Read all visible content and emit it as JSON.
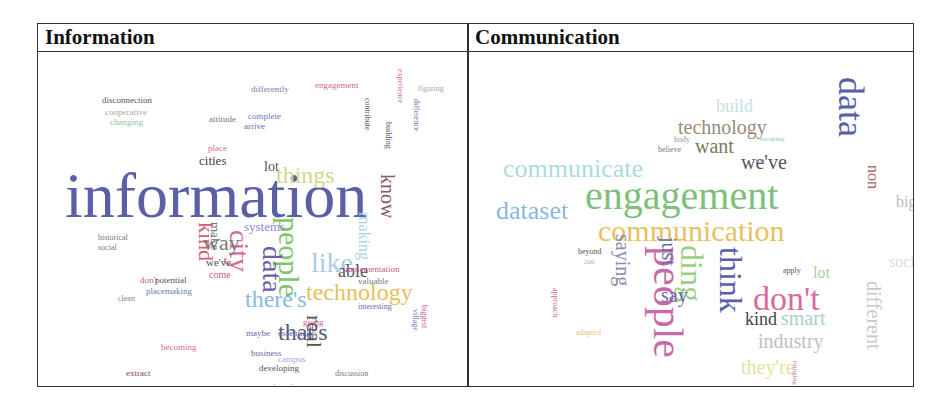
{
  "table": {
    "headers": [
      "Information",
      "Communication"
    ]
  },
  "clouds": {
    "information": {
      "words": [
        {
          "t": "information",
          "x": 27,
          "y": 112,
          "s": 64,
          "c": "#5a5fa8",
          "r": 0
        },
        {
          "t": "technology",
          "x": 268,
          "y": 228,
          "s": 24,
          "c": "#e8c05a",
          "r": 0
        },
        {
          "t": "people",
          "x": 236,
          "y": 165,
          "s": 30,
          "c": "#7ec46a",
          "r": 1
        },
        {
          "t": "there's",
          "x": 207,
          "y": 235,
          "s": 24,
          "c": "#8ab8e0",
          "r": 0
        },
        {
          "t": "that's",
          "x": 240,
          "y": 268,
          "s": 24,
          "c": "#555a80",
          "r": 0
        },
        {
          "t": "things",
          "x": 238,
          "y": 111,
          "s": 24,
          "c": "#d0d890",
          "r": 0
        },
        {
          "t": "data",
          "x": 220,
          "y": 194,
          "s": 28,
          "c": "#6a62a8",
          "r": 1
        },
        {
          "t": "city",
          "x": 187,
          "y": 178,
          "s": 28,
          "c": "#d86a9a",
          "r": 1
        },
        {
          "t": "like",
          "x": 273,
          "y": 197,
          "s": 28,
          "c": "#a8cce8",
          "r": 0
        },
        {
          "t": "know",
          "x": 340,
          "y": 122,
          "s": 20,
          "c": "#8a5a6a",
          "r": 1
        },
        {
          "t": "kind",
          "x": 157,
          "y": 170,
          "s": 22,
          "c": "#d85a7a",
          "r": 1
        },
        {
          "t": "way",
          "x": 165,
          "y": 180,
          "s": 22,
          "c": "#777",
          "r": 0
        },
        {
          "t": "real",
          "x": 265,
          "y": 263,
          "s": 22,
          "c": "#555",
          "r": 1
        },
        {
          "t": "able",
          "x": 300,
          "y": 210,
          "s": 18,
          "c": "#555",
          "r": 0
        },
        {
          "t": "cities",
          "x": 161,
          "y": 102,
          "s": 13,
          "c": "#444",
          "r": 0
        },
        {
          "t": "lot",
          "x": 226,
          "y": 108,
          "s": 14,
          "c": "#555",
          "r": 0
        },
        {
          "t": "systems",
          "x": 206,
          "y": 168,
          "s": 13,
          "c": "#8a8ad8",
          "r": 0
        },
        {
          "t": "making",
          "x": 318,
          "y": 160,
          "s": 16,
          "c": "#a8d8e0",
          "r": 1
        },
        {
          "t": "make",
          "x": 171,
          "y": 170,
          "s": 13,
          "c": "#777",
          "r": 1
        },
        {
          "t": "implementation",
          "x": 305,
          "y": 213,
          "s": 9,
          "c": "#c85a8a",
          "r": 0
        },
        {
          "t": "valuable",
          "x": 320,
          "y": 225,
          "s": 9,
          "c": "#777",
          "r": 0
        },
        {
          "t": "disconnection",
          "x": 64,
          "y": 44,
          "s": 9,
          "c": "#555",
          "r": 0
        },
        {
          "t": "cooperative",
          "x": 67,
          "y": 56,
          "s": 9,
          "c": "#aaa",
          "r": 0
        },
        {
          "t": "changing",
          "x": 72,
          "y": 66,
          "s": 9,
          "c": "#8ac8a0",
          "r": 0
        },
        {
          "t": "historical",
          "x": 60,
          "y": 182,
          "s": 8,
          "c": "#777",
          "r": 0
        },
        {
          "t": "social",
          "x": 60,
          "y": 192,
          "s": 8,
          "c": "#777",
          "r": 0
        },
        {
          "t": "don't",
          "x": 102,
          "y": 224,
          "s": 9,
          "c": "#c85a8a",
          "r": 0
        },
        {
          "t": "potential",
          "x": 117,
          "y": 224,
          "s": 9,
          "c": "#555",
          "r": 0
        },
        {
          "t": "placemaking",
          "x": 108,
          "y": 235,
          "s": 9,
          "c": "#6a7ab8",
          "r": 0
        },
        {
          "t": "clean",
          "x": 80,
          "y": 243,
          "s": 8,
          "c": "#888",
          "r": 0
        },
        {
          "t": "becoming",
          "x": 123,
          "y": 291,
          "s": 9,
          "c": "#d86a9a",
          "r": 0
        },
        {
          "t": "extract",
          "x": 88,
          "y": 317,
          "s": 9,
          "c": "#8a3a6a",
          "r": 0
        },
        {
          "t": "ghost",
          "x": 104,
          "y": 338,
          "s": 9,
          "c": "#8a6aa8",
          "r": 0
        },
        {
          "t": "feedback",
          "x": 150,
          "y": 345,
          "s": 9,
          "c": "#555",
          "r": 0
        },
        {
          "t": "favourite",
          "x": 206,
          "y": 343,
          "s": 9,
          "c": "#7a7ab8",
          "r": 0
        },
        {
          "t": "engineering",
          "x": 222,
          "y": 331,
          "s": 9,
          "c": "#5a6a8a",
          "r": 0
        },
        {
          "t": "embarrassment",
          "x": 298,
          "y": 334,
          "s": 9,
          "c": "#6a6aa8",
          "r": 0
        },
        {
          "t": "figure",
          "x": 320,
          "y": 345,
          "s": 8,
          "c": "#a8c8e8",
          "r": 0
        },
        {
          "t": "developing",
          "x": 221,
          "y": 312,
          "s": 9,
          "c": "#555",
          "r": 0
        },
        {
          "t": "discussion",
          "x": 297,
          "y": 318,
          "s": 8,
          "c": "#777",
          "r": 0
        },
        {
          "t": "business",
          "x": 213,
          "y": 297,
          "s": 9,
          "c": "#6a6a9a",
          "r": 0
        },
        {
          "t": "campus",
          "x": 240,
          "y": 303,
          "s": 9,
          "c": "#a8a8d8",
          "r": 0
        },
        {
          "t": "maybe",
          "x": 208,
          "y": 277,
          "s": 9,
          "c": "#6a6aa8",
          "r": 0
        },
        {
          "t": "essentially",
          "x": 240,
          "y": 277,
          "s": 9,
          "c": "#6a6aa8",
          "r": 0
        },
        {
          "t": "going",
          "x": 265,
          "y": 266,
          "s": 9,
          "c": "#c85a8a",
          "r": 0
        },
        {
          "t": "interesting",
          "x": 320,
          "y": 251,
          "s": 8,
          "c": "#6a6aa8",
          "r": 0
        },
        {
          "t": "biggest",
          "x": 382,
          "y": 253,
          "s": 8,
          "c": "#c85a8a",
          "r": 1
        },
        {
          "t": "village",
          "x": 373,
          "y": 257,
          "s": 8,
          "c": "#7a7ab8",
          "r": 1
        },
        {
          "t": "engagement",
          "x": 277,
          "y": 29,
          "s": 9,
          "c": "#c86a9a",
          "r": 0
        },
        {
          "t": "differently",
          "x": 213,
          "y": 33,
          "s": 9,
          "c": "#7a7ab8",
          "r": 0
        },
        {
          "t": "complete",
          "x": 210,
          "y": 60,
          "s": 9,
          "c": "#6a7ab8",
          "r": 0
        },
        {
          "t": "attitude",
          "x": 171,
          "y": 63,
          "s": 9,
          "c": "#777",
          "r": 0
        },
        {
          "t": "arrive",
          "x": 206,
          "y": 70,
          "s": 9,
          "c": "#6a6aa8",
          "r": 0
        },
        {
          "t": "place",
          "x": 170,
          "y": 92,
          "s": 9,
          "c": "#d86aa8",
          "r": 0
        },
        {
          "t": "difference",
          "x": 374,
          "y": 47,
          "s": 8,
          "c": "#7a6aa8",
          "r": 1
        },
        {
          "t": "figuring",
          "x": 380,
          "y": 33,
          "s": 8,
          "c": "#aaa",
          "r": 0
        },
        {
          "t": "building",
          "x": 346,
          "y": 70,
          "s": 8,
          "c": "#555",
          "r": 1
        },
        {
          "t": "contribute",
          "x": 325,
          "y": 46,
          "s": 8,
          "c": "#555",
          "r": 1
        },
        {
          "t": "we've",
          "x": 168,
          "y": 205,
          "s": 11,
          "c": "#555",
          "r": 0
        },
        {
          "t": "come",
          "x": 171,
          "y": 218,
          "s": 10,
          "c": "#c85a8a",
          "r": 0
        },
        {
          "t": "experience",
          "x": 358,
          "y": 17,
          "s": 8,
          "c": "#d86aa8",
          "r": 1
        }
      ]
    },
    "communication": {
      "words": [
        {
          "t": "communications",
          "x": 444,
          "y": 8,
          "s": 40,
          "c": "#4a5ab0",
          "r": 1
        },
        {
          "t": "engagement",
          "x": 116,
          "y": 124,
          "s": 40,
          "c": "#7cc07a",
          "r": 0
        },
        {
          "t": "communication",
          "x": 129,
          "y": 164,
          "s": 30,
          "c": "#e8c060",
          "r": 0
        },
        {
          "t": "communicate",
          "x": 34,
          "y": 104,
          "s": 26,
          "c": "#a8dce0",
          "r": 0
        },
        {
          "t": "dataset",
          "x": 27,
          "y": 146,
          "s": 26,
          "c": "#8ab8e0",
          "r": 0
        },
        {
          "t": "data",
          "x": 364,
          "y": 25,
          "s": 36,
          "c": "#5a5fa8",
          "r": 1
        },
        {
          "t": "people",
          "x": 178,
          "y": 194,
          "s": 42,
          "c": "#c86aa8",
          "r": 1
        },
        {
          "t": "think",
          "x": 246,
          "y": 195,
          "s": 32,
          "c": "#5a5fa8",
          "r": 1
        },
        {
          "t": "ding",
          "x": 207,
          "y": 193,
          "s": 32,
          "c": "#9ad080",
          "r": 1
        },
        {
          "t": "don't",
          "x": 284,
          "y": 230,
          "s": 34,
          "c": "#d86a9a",
          "r": 0
        },
        {
          "t": "technology",
          "x": 209,
          "y": 65,
          "s": 20,
          "c": "#9a8a7a",
          "r": 0
        },
        {
          "t": "want",
          "x": 226,
          "y": 84,
          "s": 20,
          "c": "#7a7a5a",
          "r": 0
        },
        {
          "t": "we've",
          "x": 272,
          "y": 100,
          "s": 20,
          "c": "#555",
          "r": 0
        },
        {
          "t": "saying",
          "x": 144,
          "y": 182,
          "s": 20,
          "c": "#8a8aa8",
          "r": 1
        },
        {
          "t": "just",
          "x": 190,
          "y": 185,
          "s": 20,
          "c": "#6a6aa8",
          "r": 1
        },
        {
          "t": "say",
          "x": 192,
          "y": 233,
          "s": 20,
          "c": "#6a6aa8",
          "r": 0
        },
        {
          "t": "kind",
          "x": 276,
          "y": 258,
          "s": 18,
          "c": "#444",
          "r": 0
        },
        {
          "t": "smart",
          "x": 312,
          "y": 256,
          "s": 20,
          "c": "#a8d0d0",
          "r": 0
        },
        {
          "t": "industry",
          "x": 289,
          "y": 279,
          "s": 20,
          "c": "#c0c0c0",
          "r": 0
        },
        {
          "t": "different",
          "x": 395,
          "y": 229,
          "s": 20,
          "c": "#c8c8c8",
          "r": 1
        },
        {
          "t": "non",
          "x": 396,
          "y": 113,
          "s": 16,
          "c": "#a86a6a",
          "r": 1
        },
        {
          "t": "big",
          "x": 427,
          "y": 142,
          "s": 16,
          "c": "#bbb",
          "r": 0
        },
        {
          "t": "social",
          "x": 420,
          "y": 202,
          "s": 16,
          "c": "#e8d8d8",
          "r": 0
        },
        {
          "t": "lot",
          "x": 344,
          "y": 213,
          "s": 16,
          "c": "#aad0a0",
          "r": 0
        },
        {
          "t": "they're",
          "x": 272,
          "y": 305,
          "s": 20,
          "c": "#e8e0a0",
          "r": 0
        },
        {
          "t": "build",
          "x": 247,
          "y": 45,
          "s": 18,
          "c": "#c8e0e8",
          "r": 0
        },
        {
          "t": "beyond",
          "x": 109,
          "y": 196,
          "s": 8,
          "c": "#555",
          "r": 0
        },
        {
          "t": "apply",
          "x": 314,
          "y": 215,
          "s": 8,
          "c": "#555",
          "r": 0
        },
        {
          "t": "believe",
          "x": 189,
          "y": 94,
          "s": 8,
          "c": "#777",
          "r": 0
        },
        {
          "t": "body",
          "x": 205,
          "y": 84,
          "s": 8,
          "c": "#999",
          "r": 0
        },
        {
          "t": "breaking",
          "x": 291,
          "y": 84,
          "s": 7,
          "c": "#8ac8c8",
          "r": 0
        },
        {
          "t": "approach",
          "x": 82,
          "y": 236,
          "s": 8,
          "c": "#c86a9a",
          "r": 1
        },
        {
          "t": "adapted",
          "x": 107,
          "y": 277,
          "s": 8,
          "c": "#e8c080",
          "r": 0
        },
        {
          "t": "200",
          "x": 115,
          "y": 207,
          "s": 7,
          "c": "#c8a0a0",
          "r": 0
        },
        {
          "t": "300",
          "x": 285,
          "y": 106,
          "s": 7,
          "c": "#a0a0c8",
          "r": 0
        },
        {
          "t": "bringing",
          "x": 322,
          "y": 309,
          "s": 7,
          "c": "#a86aa8",
          "r": 1
        }
      ]
    }
  }
}
